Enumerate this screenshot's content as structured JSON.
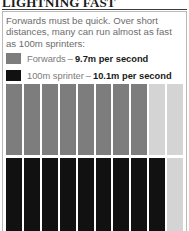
{
  "title": "LIGHTNING FAST",
  "intro": "Forwards must be quick. Over short distances, many can run almost as fast as 100m sprinters:",
  "legend": [
    {
      "swatch_color": "#7d7d7d",
      "label": "Forwards",
      "dash": "–",
      "value": "9.7m per second"
    },
    {
      "swatch_color": "#111111",
      "label": "100m sprinter",
      "dash": "–",
      "value": "10.1m per second"
    }
  ],
  "colors": {
    "forwards_bar": "#7d7d7d",
    "sprinter_bar": "#111111",
    "empty_bar": "#d4d4d4",
    "frame_border": "#b9b9b9",
    "body_text": "#6d6d6d",
    "title_text": "#1a1a1a"
  },
  "chart_data": {
    "type": "bar",
    "title": "LIGHTNING FAST",
    "xlabel": "",
    "ylabel": "",
    "orientation": "horizontal-segments",
    "units": "m per second",
    "segment_count": 10,
    "segment_value": 1,
    "xlim": [
      0,
      10
    ],
    "grid": false,
    "legend_position": "top",
    "categories": [
      "Forwards",
      "100m sprinter"
    ],
    "values": [
      9.7,
      10.1
    ],
    "series": [
      {
        "name": "Forwards",
        "value": 9.7,
        "value_label": "9.7m per second",
        "color": "#7d7d7d",
        "filled_segments": 8,
        "segments": [
          "filled",
          "filled",
          "filled",
          "filled",
          "filled",
          "filled",
          "filled",
          "filled",
          "empty",
          "empty"
        ]
      },
      {
        "name": "100m sprinter",
        "value": 10.1,
        "value_label": "10.1m per second",
        "color": "#111111",
        "filled_segments": 9,
        "segments": [
          "filled",
          "filled",
          "filled",
          "filled",
          "filled",
          "filled",
          "filled",
          "filled",
          "filled",
          "empty"
        ]
      }
    ]
  }
}
